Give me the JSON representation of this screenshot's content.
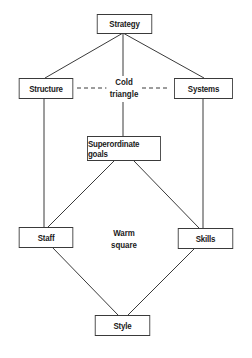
{
  "diagram": {
    "nodes": {
      "strategy": "Strategy",
      "structure": "Structure",
      "systems": "Systems",
      "superordinate_goals": "Superordinate goals",
      "staff": "Staff",
      "skills": "Skills",
      "style": "Style"
    },
    "groups": {
      "cold_line1": "Cold",
      "cold_line2": "triangle",
      "warm_line1": "Warm",
      "warm_line2": "square"
    },
    "edges": [
      {
        "from": "Strategy",
        "to": "Structure",
        "style": "solid"
      },
      {
        "from": "Strategy",
        "to": "Systems",
        "style": "solid"
      },
      {
        "from": "Strategy",
        "to": "Superordinate goals",
        "style": "solid"
      },
      {
        "from": "Structure",
        "to": "Systems",
        "style": "dashed"
      },
      {
        "from": "Structure",
        "to": "Staff",
        "style": "solid"
      },
      {
        "from": "Systems",
        "to": "Skills",
        "style": "solid"
      },
      {
        "from": "Superordinate goals",
        "to": "Staff",
        "style": "solid"
      },
      {
        "from": "Superordinate goals",
        "to": "Skills",
        "style": "solid"
      },
      {
        "from": "Staff",
        "to": "Style",
        "style": "solid"
      },
      {
        "from": "Skills",
        "to": "Style",
        "style": "solid"
      }
    ],
    "colors": {
      "line": "#3a3a3a",
      "text": "#1a1a1a",
      "background": "#ffffff"
    }
  }
}
